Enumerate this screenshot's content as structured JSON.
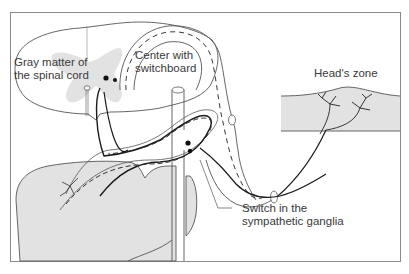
{
  "diagram": {
    "colors": {
      "frame": "#8a8a8a",
      "outline": "#555555",
      "gray_fill": "#e2e2e2",
      "nerve": "#1a1a1a",
      "label_text": "#3a3a3a"
    },
    "labels": {
      "gray_matter": {
        "line1": "Gray matter of",
        "line2": "the spinal cord"
      },
      "center": {
        "line1": "Center with",
        "line2": "switchboard"
      },
      "heads_zone": {
        "line1": "Head's zone"
      },
      "switch_ganglia": {
        "line1": "Switch in the",
        "line2": "sympathetic ganglia"
      }
    },
    "structures": [
      {
        "name": "spinal-cord-cross-section"
      },
      {
        "name": "gray-matter"
      },
      {
        "name": "spinal-nerve"
      },
      {
        "name": "sympathetic-ganglion"
      },
      {
        "name": "visceral-organ"
      },
      {
        "name": "skin-dermatome"
      }
    ]
  }
}
